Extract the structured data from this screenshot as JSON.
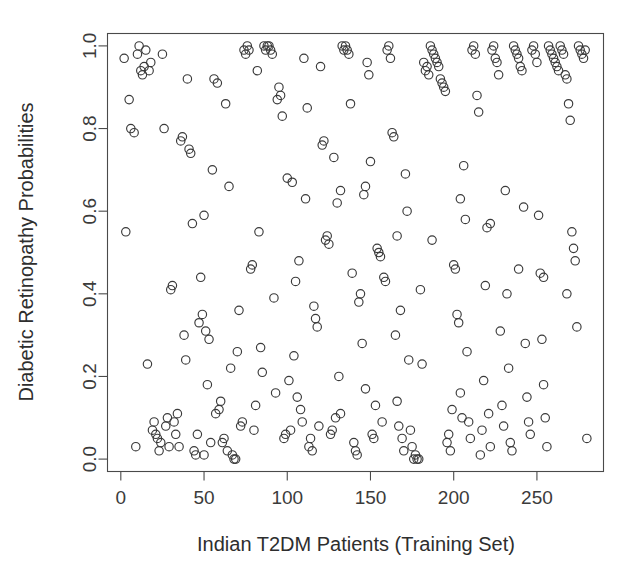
{
  "chart_data": {
    "type": "scatter",
    "title": "",
    "xlabel": "Indian T2DM Patients (Training Set)",
    "ylabel": "Diabetic Retinopathy Probabilities",
    "xlim": [
      -8,
      290
    ],
    "ylim": [
      -0.03,
      1.03
    ],
    "xticks": [
      0,
      50,
      100,
      150,
      200,
      250
    ],
    "xtick_labels": [
      "0",
      "50",
      "100",
      "150",
      "200",
      "250"
    ],
    "yticks": [
      0.0,
      0.2,
      0.4,
      0.6,
      0.8,
      1.0
    ],
    "ytick_labels": [
      "0.0",
      "0.2",
      "0.4",
      "0.6",
      "0.8",
      "1.0"
    ],
    "grid": false,
    "legend": false,
    "marker": "open-circle",
    "marker_size": 4.2,
    "marker_color": "#3a3a3a",
    "frame": true,
    "n_points": 298,
    "series": [
      {
        "name": "patients",
        "points": [
          [
            2,
            0.97
          ],
          [
            3,
            0.55
          ],
          [
            5,
            0.87
          ],
          [
            6,
            0.8
          ],
          [
            8,
            0.79
          ],
          [
            9,
            0.03
          ],
          [
            10,
            0.98
          ],
          [
            11,
            1.0
          ],
          [
            12,
            0.94
          ],
          [
            13,
            0.93
          ],
          [
            14,
            0.95
          ],
          [
            15,
            0.99
          ],
          [
            16,
            0.23
          ],
          [
            17,
            0.94
          ],
          [
            18,
            0.96
          ],
          [
            19,
            0.07
          ],
          [
            20,
            0.09
          ],
          [
            21,
            0.06
          ],
          [
            22,
            0.05
          ],
          [
            23,
            0.02
          ],
          [
            24,
            0.04
          ],
          [
            26,
            0.8
          ],
          [
            27,
            0.08
          ],
          [
            28,
            0.1
          ],
          [
            29,
            0.03
          ],
          [
            30,
            0.41
          ],
          [
            31,
            0.42
          ],
          [
            32,
            0.09
          ],
          [
            33,
            0.06
          ],
          [
            34,
            0.11
          ],
          [
            35,
            0.03
          ],
          [
            36,
            0.77
          ],
          [
            37,
            0.78
          ],
          [
            38,
            0.3
          ],
          [
            39,
            0.24
          ],
          [
            41,
            0.75
          ],
          [
            42,
            0.74
          ],
          [
            43,
            0.57
          ],
          [
            44,
            0.02
          ],
          [
            45,
            0.01
          ],
          [
            47,
            0.33
          ],
          [
            48,
            0.44
          ],
          [
            49,
            0.35
          ],
          [
            51,
            0.31
          ],
          [
            52,
            0.18
          ],
          [
            53,
            0.29
          ],
          [
            55,
            0.7
          ],
          [
            56,
            0.92
          ],
          [
            58,
            0.91
          ],
          [
            59,
            0.12
          ],
          [
            60,
            0.14
          ],
          [
            61,
            0.04
          ],
          [
            62,
            0.05
          ],
          [
            63,
            0.86
          ],
          [
            65,
            0.66
          ],
          [
            66,
            0.22
          ],
          [
            67,
            0.01
          ],
          [
            68,
            0.0
          ],
          [
            69,
            0.0
          ],
          [
            70,
            0.26
          ],
          [
            71,
            0.36
          ],
          [
            72,
            0.08
          ],
          [
            73,
            0.09
          ],
          [
            74,
            0.99
          ],
          [
            75,
            0.98
          ],
          [
            76,
            1.0
          ],
          [
            77,
            0.99
          ],
          [
            78,
            0.46
          ],
          [
            79,
            0.47
          ],
          [
            80,
            0.07
          ],
          [
            81,
            0.13
          ],
          [
            82,
            0.94
          ],
          [
            83,
            0.55
          ],
          [
            84,
            0.27
          ],
          [
            85,
            0.21
          ],
          [
            86,
            1.0
          ],
          [
            87,
            0.99
          ],
          [
            88,
            1.0
          ],
          [
            89,
            1.0
          ],
          [
            90,
            0.99
          ],
          [
            91,
            0.98
          ],
          [
            92,
            0.39
          ],
          [
            93,
            0.16
          ],
          [
            94,
            0.87
          ],
          [
            95,
            0.9
          ],
          [
            96,
            0.88
          ],
          [
            97,
            0.83
          ],
          [
            98,
            0.05
          ],
          [
            99,
            0.06
          ],
          [
            100,
            0.68
          ],
          [
            101,
            0.19
          ],
          [
            103,
            0.67
          ],
          [
            104,
            0.25
          ],
          [
            105,
            0.43
          ],
          [
            106,
            0.15
          ],
          [
            107,
            0.48
          ],
          [
            108,
            0.12
          ],
          [
            109,
            0.09
          ],
          [
            110,
            0.97
          ],
          [
            111,
            0.63
          ],
          [
            112,
            0.85
          ],
          [
            113,
            0.03
          ],
          [
            114,
            0.05
          ],
          [
            115,
            0.02
          ],
          [
            116,
            0.37
          ],
          [
            117,
            0.34
          ],
          [
            118,
            0.32
          ],
          [
            119,
            0.08
          ],
          [
            120,
            0.95
          ],
          [
            121,
            0.76
          ],
          [
            122,
            0.77
          ],
          [
            123,
            0.53
          ],
          [
            124,
            0.54
          ],
          [
            125,
            0.52
          ],
          [
            126,
            0.06
          ],
          [
            127,
            0.07
          ],
          [
            128,
            0.73
          ],
          [
            129,
            0.1
          ],
          [
            130,
            0.62
          ],
          [
            131,
            0.2
          ],
          [
            132,
            0.11
          ],
          [
            133,
            1.0
          ],
          [
            134,
            0.99
          ],
          [
            135,
            1.0
          ],
          [
            136,
            0.99
          ],
          [
            137,
            0.98
          ],
          [
            138,
            0.86
          ],
          [
            139,
            0.45
          ],
          [
            140,
            0.04
          ],
          [
            141,
            0.02
          ],
          [
            142,
            0.01
          ],
          [
            143,
            0.38
          ],
          [
            144,
            0.4
          ],
          [
            145,
            0.28
          ],
          [
            146,
            0.64
          ],
          [
            147,
            0.17
          ],
          [
            148,
            0.96
          ],
          [
            149,
            0.93
          ],
          [
            150,
            0.72
          ],
          [
            151,
            0.06
          ],
          [
            152,
            0.05
          ],
          [
            153,
            0.13
          ],
          [
            154,
            0.51
          ],
          [
            155,
            0.5
          ],
          [
            156,
            0.49
          ],
          [
            157,
            0.09
          ],
          [
            158,
            0.44
          ],
          [
            159,
            0.43
          ],
          [
            160,
            0.99
          ],
          [
            161,
            1.0
          ],
          [
            162,
            0.97
          ],
          [
            163,
            0.79
          ],
          [
            164,
            0.78
          ],
          [
            165,
            0.3
          ],
          [
            166,
            0.14
          ],
          [
            167,
            0.08
          ],
          [
            168,
            0.36
          ],
          [
            169,
            0.05
          ],
          [
            170,
            0.02
          ],
          [
            171,
            0.69
          ],
          [
            172,
            0.6
          ],
          [
            173,
            0.24
          ],
          [
            174,
            0.07
          ],
          [
            175,
            0.03
          ],
          [
            176,
            0.0
          ],
          [
            177,
            0.01
          ],
          [
            178,
            0.0
          ],
          [
            179,
            0.0
          ],
          [
            180,
            0.41
          ],
          [
            181,
            0.23
          ],
          [
            182,
            0.96
          ],
          [
            183,
            0.94
          ],
          [
            184,
            0.95
          ],
          [
            185,
            0.93
          ],
          [
            186,
            1.0
          ],
          [
            187,
            0.99
          ],
          [
            188,
            0.98
          ],
          [
            189,
            0.97
          ],
          [
            190,
            0.96
          ],
          [
            191,
            0.95
          ],
          [
            192,
            0.92
          ],
          [
            193,
            0.91
          ],
          [
            194,
            0.9
          ],
          [
            195,
            0.89
          ],
          [
            196,
            0.04
          ],
          [
            197,
            0.06
          ],
          [
            198,
            0.02
          ],
          [
            199,
            0.12
          ],
          [
            200,
            0.47
          ],
          [
            201,
            0.46
          ],
          [
            202,
            0.35
          ],
          [
            203,
            0.33
          ],
          [
            204,
            0.16
          ],
          [
            205,
            0.1
          ],
          [
            206,
            0.71
          ],
          [
            207,
            0.58
          ],
          [
            208,
            0.26
          ],
          [
            209,
            0.09
          ],
          [
            210,
            0.05
          ],
          [
            211,
            0.99
          ],
          [
            212,
            1.0
          ],
          [
            213,
            0.98
          ],
          [
            214,
            0.88
          ],
          [
            215,
            0.84
          ],
          [
            216,
            0.01
          ],
          [
            217,
            0.07
          ],
          [
            218,
            0.19
          ],
          [
            219,
            0.42
          ],
          [
            220,
            0.56
          ],
          [
            221,
            0.11
          ],
          [
            222,
            0.03
          ],
          [
            223,
            0.99
          ],
          [
            224,
            1.0
          ],
          [
            225,
            0.97
          ],
          [
            226,
            0.96
          ],
          [
            227,
            0.93
          ],
          [
            228,
            0.31
          ],
          [
            229,
            0.13
          ],
          [
            230,
            0.08
          ],
          [
            231,
            0.65
          ],
          [
            232,
            0.4
          ],
          [
            233,
            0.22
          ],
          [
            234,
            0.04
          ],
          [
            235,
            0.02
          ],
          [
            236,
            1.0
          ],
          [
            237,
            0.99
          ],
          [
            238,
            0.98
          ],
          [
            239,
            0.97
          ],
          [
            240,
            0.95
          ],
          [
            241,
            0.94
          ],
          [
            242,
            0.61
          ],
          [
            243,
            0.28
          ],
          [
            244,
            0.15
          ],
          [
            245,
            0.09
          ],
          [
            246,
            0.06
          ],
          [
            247,
            0.99
          ],
          [
            248,
            1.0
          ],
          [
            249,
            0.98
          ],
          [
            250,
            0.96
          ],
          [
            251,
            0.59
          ],
          [
            252,
            0.45
          ],
          [
            253,
            0.29
          ],
          [
            254,
            0.18
          ],
          [
            255,
            0.1
          ],
          [
            256,
            0.03
          ],
          [
            257,
            1.0
          ],
          [
            258,
            0.99
          ],
          [
            259,
            0.98
          ],
          [
            260,
            0.97
          ],
          [
            261,
            0.96
          ],
          [
            262,
            0.95
          ],
          [
            263,
            0.94
          ],
          [
            264,
            1.0
          ],
          [
            265,
            0.99
          ],
          [
            266,
            0.98
          ],
          [
            267,
            0.93
          ],
          [
            268,
            0.92
          ],
          [
            269,
            0.86
          ],
          [
            270,
            0.82
          ],
          [
            271,
            0.55
          ],
          [
            272,
            0.51
          ],
          [
            273,
            0.48
          ],
          [
            274,
            0.32
          ],
          [
            275,
            1.0
          ],
          [
            276,
            0.99
          ],
          [
            277,
            0.98
          ],
          [
            278,
            0.97
          ],
          [
            279,
            0.99
          ],
          [
            280,
            0.05
          ],
          [
            25,
            0.98
          ],
          [
            40,
            0.92
          ],
          [
            46,
            0.06
          ],
          [
            50,
            0.01
          ],
          [
            54,
            0.04
          ],
          [
            57,
            0.11
          ],
          [
            64,
            0.02
          ],
          [
            102,
            0.07
          ],
          [
            50,
            0.59
          ],
          [
            132,
            0.65
          ],
          [
            147,
            0.66
          ],
          [
            166,
            0.54
          ],
          [
            187,
            0.53
          ],
          [
            204,
            0.63
          ],
          [
            222,
            0.57
          ],
          [
            239,
            0.46
          ],
          [
            254,
            0.44
          ],
          [
            268,
            0.4
          ]
        ]
      }
    ]
  },
  "axes": {
    "x_axis_name": "x-axis",
    "y_axis_name": "y-axis"
  }
}
